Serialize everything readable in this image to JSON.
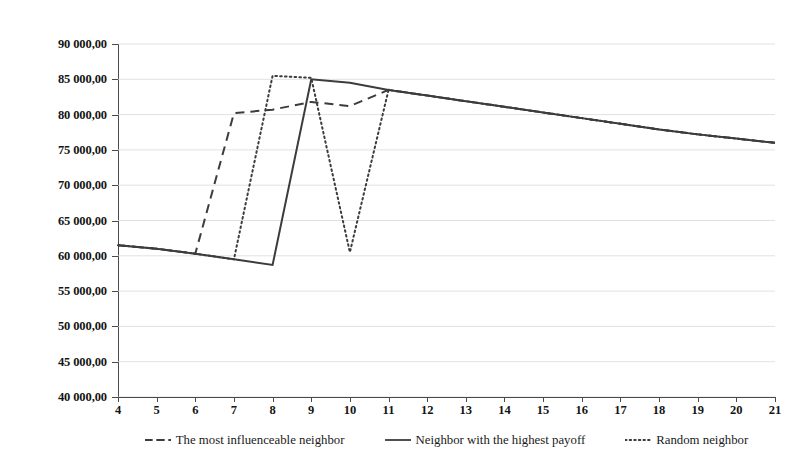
{
  "chart_data": {
    "type": "line",
    "title": "",
    "subtitle": "",
    "xlabel": "",
    "ylabel": "",
    "categories": [
      4,
      5,
      6,
      7,
      8,
      9,
      10,
      11,
      12,
      13,
      14,
      15,
      16,
      17,
      18,
      19,
      20,
      21
    ],
    "tick_labels_x": [
      "4",
      "5",
      "6",
      "7",
      "8",
      "9",
      "10",
      "11",
      "12",
      "13",
      "14",
      "15",
      "16",
      "17",
      "18",
      "19",
      "20",
      "21"
    ],
    "tick_labels_y": [
      "40 000,00",
      "45 000,00",
      "50 000,00",
      "55 000,00",
      "60 000,00",
      "65 000,00",
      "70 000,00",
      "75 000,00",
      "80 000,00",
      "85 000,00",
      "90 000,00"
    ],
    "ylim": [
      40000,
      90000
    ],
    "ytick_step": 5000,
    "grid": true,
    "grid_axis": "y",
    "legend_position": "bottom",
    "series": [
      {
        "name": "The most influenceable neighbor",
        "style": "dashed",
        "color": "#3c3c3c",
        "values": [
          61500,
          61000,
          60300,
          80200,
          80700,
          81800,
          81200,
          83500,
          82700,
          81900,
          81100,
          80300,
          79500,
          78700,
          77900,
          77200,
          76600,
          76000
        ]
      },
      {
        "name": "Neighbor with the highest payoff",
        "style": "solid",
        "color": "#3c3c3c",
        "values": [
          61500,
          61000,
          60300,
          59500,
          58700,
          85000,
          84500,
          83500,
          82700,
          81900,
          81100,
          80300,
          79500,
          78700,
          77900,
          77200,
          76600,
          76000
        ]
      },
      {
        "name": "Random neighbor",
        "style": "dotted",
        "color": "#3c3c3c",
        "values": [
          61500,
          61000,
          60300,
          59500,
          85500,
          85200,
          60500,
          83500,
          82700,
          81900,
          81100,
          80300,
          79500,
          78700,
          77900,
          77200,
          76600,
          76000
        ]
      }
    ]
  },
  "legend": {
    "items": [
      {
        "label": "The most influenceable neighbor",
        "style": "dashed"
      },
      {
        "label": "Neighbor with the highest payoff",
        "style": "solid"
      },
      {
        "label": "Random neighbor",
        "style": "dotted"
      }
    ]
  }
}
